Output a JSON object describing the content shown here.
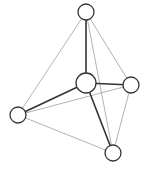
{
  "diagram": {
    "type": "graph",
    "nodes": [
      {
        "id": "top",
        "x": 86,
        "y": 12,
        "r": 8
      },
      {
        "id": "center",
        "x": 86,
        "y": 83,
        "r": 10
      },
      {
        "id": "right",
        "x": 131,
        "y": 85,
        "r": 8
      },
      {
        "id": "left",
        "x": 18,
        "y": 115,
        "r": 8
      },
      {
        "id": "bottom",
        "x": 113,
        "y": 153,
        "r": 8
      }
    ],
    "edges": [
      {
        "from": "top",
        "to": "left",
        "style": "light"
      },
      {
        "from": "top",
        "to": "right",
        "style": "light"
      },
      {
        "from": "top",
        "to": "bottom",
        "style": "light"
      },
      {
        "from": "left",
        "to": "right",
        "style": "light"
      },
      {
        "from": "left",
        "to": "bottom",
        "style": "light"
      },
      {
        "from": "right",
        "to": "bottom",
        "style": "light"
      },
      {
        "from": "top",
        "to": "center",
        "style": "dark"
      },
      {
        "from": "center",
        "to": "left",
        "style": "dark"
      },
      {
        "from": "center",
        "to": "right",
        "style": "dark"
      },
      {
        "from": "center",
        "to": "bottom",
        "style": "dark"
      }
    ],
    "colors": {
      "dark_edge": "#333333",
      "light_edge": "#aaaaaa",
      "node_stroke": "#333333",
      "node_fill": "#ffffff"
    }
  }
}
